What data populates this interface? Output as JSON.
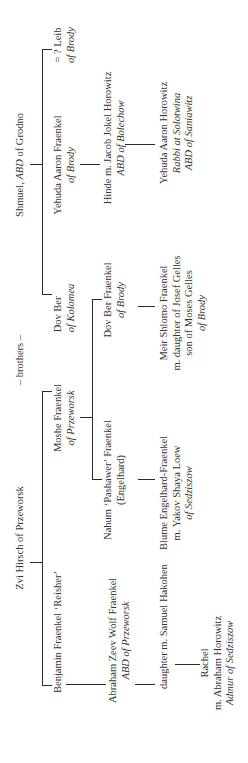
{
  "diagram": {
    "type": "family-tree",
    "orientation": "rotated-90-ccw",
    "line_color": "#2a2a2a",
    "text_color": "#333333"
  },
  "ancestors": {
    "zvi_hirsch": {
      "name": "Zvi Hirsch of Przeworsk"
    },
    "brothers_label": "– brothers –",
    "shmuel": {
      "name": "Shmuel, ",
      "title": "ABD",
      "place": " of Grodno"
    }
  },
  "generation1": {
    "benjamin": {
      "name": "Benjamin Fraenkel ‘Reisher’"
    },
    "moshe": {
      "name": "Moshe Fraenkel",
      "place": "of Przeworsk"
    },
    "dov_ber_kolomea": {
      "name": "Dov Ber",
      "place": "of Kolomea"
    },
    "yehuda_aaron_fraenkel": {
      "name": "Yehuda Aaron Fraenkel",
      "place": "of Brody"
    },
    "leib": {
      "name": "= ?  Leib",
      "place": "of Brody"
    }
  },
  "generation2": {
    "abraham_zeev": {
      "name": "Abraham Zeev Wolf Fraenkel",
      "title": "ABD of Przeworsk"
    },
    "nahum": {
      "name": "Nahum ‘Pashawer’ Fraenkel",
      "alt": "(Engelhard)"
    },
    "dov_ber_fraenkel": {
      "name": "Dov Ber Fraenkel",
      "place": "of  Brody"
    },
    "hinde": {
      "name": "Hinde m. Jacob Jokel Horowitz",
      "title": "ABD of Bolechow"
    }
  },
  "generation3": {
    "daughter": {
      "name": "daughter m. Samuel Hakohen"
    },
    "blume": {
      "name": "Blume Engelhard-Fraenkel",
      "spouse": "m. Yakov Shaya Loew",
      "place": "of Sedziszow"
    },
    "meir_shlomo": {
      "name": "Meir Shlomo Fraenkel",
      "spouse": "m. daughter of Josef Gelles",
      "spouse2": "son of Moses Gelles",
      "place": "of Brody"
    },
    "yehuda_aaron_horowitz": {
      "name": "Yehuda Aaron Horowitz",
      "title1": "Rabbi at Solotwina",
      "title2": "ABD of Saniawitz"
    }
  },
  "generation4": {
    "rachel": {
      "name": "Rachel",
      "spouse": "m. Abraham Horowitz",
      "title": "Admur of Sedziszow"
    }
  }
}
